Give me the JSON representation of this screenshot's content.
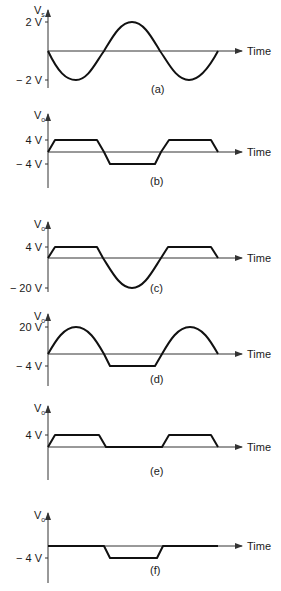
{
  "x_axis_label": "Time",
  "panels": [
    {
      "id": "a",
      "caption": "(a)",
      "y_label_main": "V",
      "y_label_sub": "s",
      "ticks": [
        "2 V",
        "− 2 V"
      ],
      "description": "Input sine wave, amplitude 2 V, starting at zero going negative"
    },
    {
      "id": "b",
      "caption": "(b)",
      "y_label_main": "V",
      "y_label_sub": "o",
      "ticks": [
        "4 V",
        "− 4 V"
      ],
      "description": "Output clipped at +4 V and -4 V (trapezoidal)"
    },
    {
      "id": "c",
      "caption": "(c)",
      "y_label_main": "V",
      "y_label_sub": "o",
      "ticks": [
        "4 V",
        "− 20 V"
      ],
      "description": "Clipped at +4 V, negative half-cycle down to -20 V"
    },
    {
      "id": "d",
      "caption": "(d)",
      "y_label_main": "V",
      "y_label_sub": "o",
      "ticks": [
        "20 V",
        "− 4 V"
      ],
      "description": "Positive half-cycles to 20 V, clipped at -4 V"
    },
    {
      "id": "e",
      "caption": "(e)",
      "y_label_main": "V",
      "y_label_sub": "o",
      "ticks": [
        "4 V"
      ],
      "description": "Positive clipped at 4 V, negative half removed (0 V)"
    },
    {
      "id": "f",
      "caption": "(f)",
      "y_label_main": "V",
      "y_label_sub": "o",
      "ticks": [
        "− 4 V"
      ],
      "description": "Positive half removed (0 V), negative clipped at -4 V"
    }
  ]
}
